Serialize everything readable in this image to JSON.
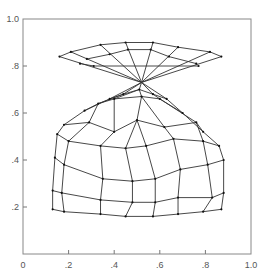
{
  "chart_data": {
    "type": "line",
    "title": "",
    "xlabel": "",
    "ylabel": "",
    "xlim": [
      0,
      1.0
    ],
    "ylim": [
      0,
      1.0
    ],
    "grid": false,
    "legend": null,
    "x_ticks": [
      "0",
      ".2",
      ".4",
      ".6",
      ".8",
      "1.0"
    ],
    "y_ticks": [
      "0",
      ".2",
      ".4",
      ".6",
      ".8",
      "1.0"
    ],
    "x_tick_values": [
      0,
      0.2,
      0.4,
      0.6,
      0.8,
      1.0
    ],
    "y_tick_values": [
      0,
      0.2,
      0.4,
      0.6,
      0.8,
      1.0
    ],
    "upper_fan": {
      "rows": [
        [
          [
            0.16,
            0.84
          ],
          [
            0.21,
            0.86
          ],
          [
            0.34,
            0.89
          ],
          [
            0.45,
            0.9
          ],
          [
            0.57,
            0.9
          ],
          [
            0.68,
            0.88
          ],
          [
            0.82,
            0.86
          ],
          [
            0.87,
            0.84
          ]
        ],
        [
          [
            0.28,
            0.83
          ],
          [
            0.38,
            0.85
          ],
          [
            0.46,
            0.87
          ],
          [
            0.56,
            0.87
          ],
          [
            0.64,
            0.84
          ],
          [
            0.76,
            0.81
          ]
        ],
        [
          [
            0.25,
            0.81
          ],
          [
            0.31,
            0.8
          ],
          [
            0.77,
            0.8
          ]
        ]
      ],
      "pinch_point": [
        0.52,
        0.73
      ]
    },
    "lower_dome": {
      "rows": [
        [
          [
            0.38,
            0.66
          ],
          [
            0.44,
            0.68
          ],
          [
            0.51,
            0.7
          ],
          [
            0.57,
            0.68
          ],
          [
            0.63,
            0.66
          ]
        ],
        [
          [
            0.27,
            0.61
          ],
          [
            0.33,
            0.64
          ],
          [
            0.4,
            0.66
          ],
          [
            0.52,
            0.67
          ],
          [
            0.6,
            0.66
          ],
          [
            0.7,
            0.6
          ]
        ],
        [
          [
            0.18,
            0.55
          ],
          [
            0.29,
            0.56
          ],
          [
            0.4,
            0.52
          ],
          [
            0.5,
            0.57
          ],
          [
            0.62,
            0.54
          ],
          [
            0.76,
            0.56
          ],
          [
            0.79,
            0.52
          ]
        ],
        [
          [
            0.15,
            0.51
          ],
          [
            0.2,
            0.48
          ],
          [
            0.34,
            0.46
          ],
          [
            0.45,
            0.45
          ],
          [
            0.54,
            0.46
          ],
          [
            0.66,
            0.49
          ],
          [
            0.79,
            0.48
          ],
          [
            0.86,
            0.46
          ]
        ],
        [
          [
            0.14,
            0.41
          ],
          [
            0.18,
            0.38
          ],
          [
            0.35,
            0.32
          ],
          [
            0.48,
            0.31
          ],
          [
            0.58,
            0.32
          ],
          [
            0.69,
            0.36
          ],
          [
            0.81,
            0.38
          ],
          [
            0.88,
            0.4
          ]
        ],
        [
          [
            0.13,
            0.27
          ],
          [
            0.17,
            0.26
          ],
          [
            0.34,
            0.23
          ],
          [
            0.48,
            0.22
          ],
          [
            0.58,
            0.22
          ],
          [
            0.68,
            0.24
          ],
          [
            0.83,
            0.24
          ],
          [
            0.88,
            0.26
          ]
        ],
        [
          [
            0.13,
            0.19
          ],
          [
            0.18,
            0.18
          ],
          [
            0.34,
            0.17
          ],
          [
            0.45,
            0.16
          ],
          [
            0.57,
            0.16
          ],
          [
            0.68,
            0.17
          ],
          [
            0.79,
            0.18
          ],
          [
            0.87,
            0.19
          ]
        ]
      ]
    }
  }
}
